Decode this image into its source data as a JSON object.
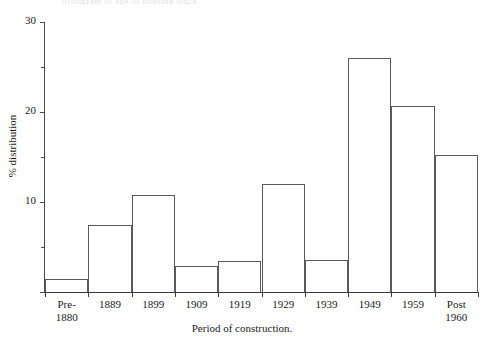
{
  "figure": {
    "top_caption": "histogram of age of housing stock"
  },
  "chart_data": {
    "type": "bar",
    "title": "",
    "subtitle": "",
    "xlabel": "Period of construction.",
    "ylabel": "% distribution",
    "categories": [
      "Pre-\n1880",
      "1889",
      "1899",
      "1909",
      "1919",
      "1929",
      "1939",
      "1949",
      "1959",
      "Post\n1960"
    ],
    "values": [
      1.5,
      7.5,
      10.8,
      2.9,
      3.5,
      12.0,
      3.6,
      26.0,
      20.7,
      15.2
    ],
    "ylim": [
      0,
      30
    ],
    "xlim": [
      0,
      10
    ],
    "y_major_ticks": [
      0,
      10,
      20,
      30
    ],
    "y_major_tick_labels": [
      "",
      "10",
      "20",
      "30"
    ],
    "y_minor_ticks": [
      5,
      15,
      25
    ],
    "grid": false,
    "legend": null,
    "bar_fill": "#ffffff",
    "bar_edge": "#5a5a5a",
    "axis_color": "#3a3a3a"
  }
}
